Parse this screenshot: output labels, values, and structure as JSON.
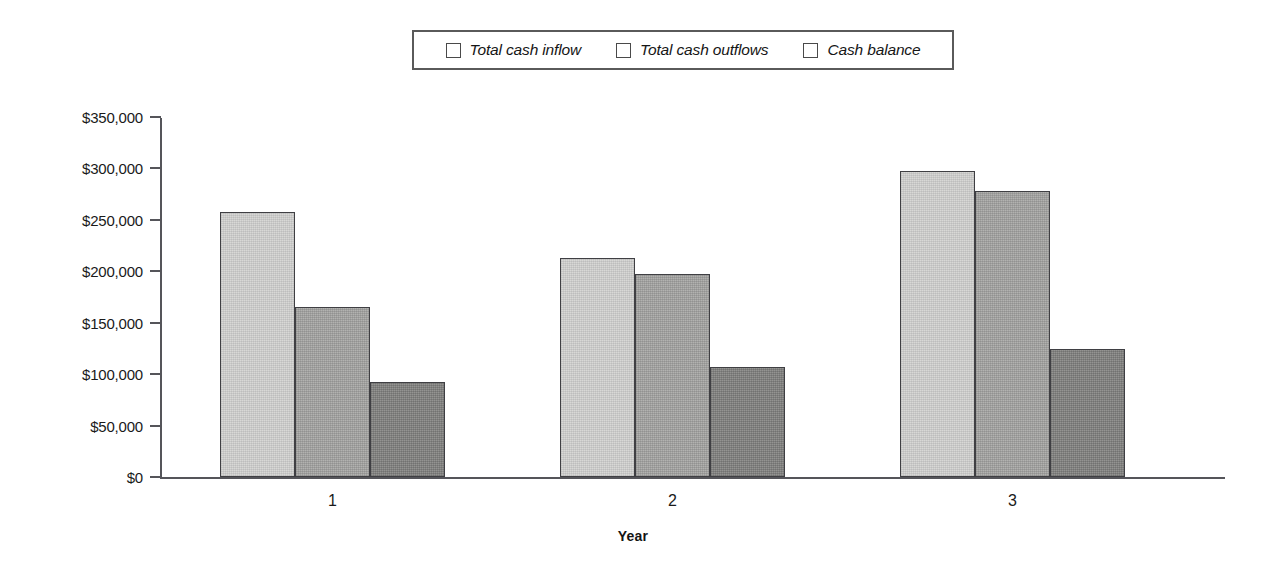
{
  "chart_data": {
    "type": "bar",
    "title": "",
    "subtitle": "",
    "xlabel": "Year",
    "ylabel": "",
    "categories": [
      "1",
      "2",
      "3"
    ],
    "series": [
      {
        "name": "Total cash inflow",
        "color": "#d8d8d6",
        "values": [
          258000,
          213000,
          298000
        ]
      },
      {
        "name": "Total cash outflows",
        "color": "#b2b2b0",
        "values": [
          165000,
          197000,
          278000
        ]
      },
      {
        "name": "Cash balance",
        "color": "#949492",
        "values": [
          92000,
          107000,
          124000
        ]
      }
    ],
    "ylim": [
      0,
      350000
    ],
    "ytick_values": [
      0,
      50000,
      100000,
      150000,
      200000,
      250000,
      300000,
      350000
    ],
    "ytick_labels": [
      "$0",
      "$50,000",
      "$100,000",
      "$150,000",
      "$200,000",
      "$250,000",
      "$300,000",
      "$350,000"
    ],
    "grid": false,
    "legend_position": "top-center",
    "legend_boxed": true,
    "legend_italic": true,
    "axis_color": "#55555a",
    "bar_border_color": "#3f3f43",
    "background": "#ffffff"
  },
  "legend": {
    "entries": [
      {
        "label": "Total cash inflow"
      },
      {
        "label": "Total cash outflows"
      },
      {
        "label": "Cash balance"
      }
    ]
  },
  "axes": {
    "x_title": "Year"
  }
}
